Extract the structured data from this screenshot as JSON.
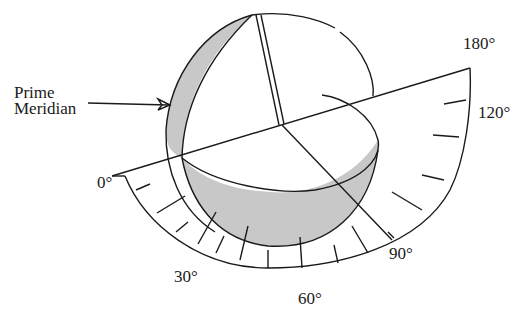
{
  "figure": {
    "type": "hemisphere-longitude-diagram",
    "labels": {
      "prime_meridian_line1": "Prime",
      "prime_meridian_line2": "Meridian"
    },
    "scale_labels": [
      "0°",
      "30°",
      "60°",
      "90°",
      "120°",
      "180°"
    ],
    "colors": {
      "line": "#1a1a1a",
      "shade": "#c8c8c8",
      "background": "#ffffff"
    }
  }
}
